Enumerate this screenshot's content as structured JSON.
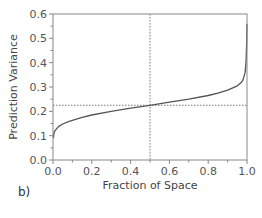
{
  "panel_label": "b)",
  "chart_data": {
    "type": "line",
    "title": "",
    "xlabel": "Fraction of Space",
    "ylabel": "Prediction Variance",
    "xlim": [
      0.0,
      1.0
    ],
    "ylim": [
      0.0,
      0.6
    ],
    "grid": false,
    "legend": null,
    "x_ticks": [
      0.0,
      0.2,
      0.4,
      0.6,
      0.8,
      1.0
    ],
    "x_tick_labels": [
      "0.0",
      "0.2",
      "0.4",
      "0.6",
      "0.8",
      "1.0"
    ],
    "x_minor_step": 0.1,
    "y_ticks": [
      0.0,
      0.1,
      0.2,
      0.3,
      0.4,
      0.5,
      0.6
    ],
    "y_tick_labels": [
      "0.0",
      "0.1",
      "0.2",
      "0.3",
      "0.4",
      "0.5",
      "0.6"
    ],
    "y_minor_step": 0.05,
    "series": [
      {
        "name": "Fraction of Design Space",
        "color": "#555555",
        "x": [
          0.002,
          0.005,
          0.01,
          0.02,
          0.03,
          0.05,
          0.08,
          0.1,
          0.15,
          0.2,
          0.3,
          0.4,
          0.5,
          0.6,
          0.7,
          0.8,
          0.85,
          0.9,
          0.93,
          0.95,
          0.97,
          0.98,
          0.99,
          0.995,
          0.998,
          1.0
        ],
        "y": [
          0.09,
          0.11,
          0.12,
          0.13,
          0.138,
          0.148,
          0.158,
          0.163,
          0.175,
          0.185,
          0.2,
          0.213,
          0.225,
          0.238,
          0.25,
          0.265,
          0.275,
          0.287,
          0.297,
          0.305,
          0.318,
          0.33,
          0.36,
          0.4,
          0.47,
          0.56
        ]
      }
    ],
    "reference_lines": [
      {
        "orientation": "vertical",
        "value": 0.5,
        "style": "dotted",
        "color": "#777777"
      },
      {
        "orientation": "horizontal",
        "value": 0.225,
        "style": "dotted",
        "color": "#777777"
      }
    ]
  }
}
